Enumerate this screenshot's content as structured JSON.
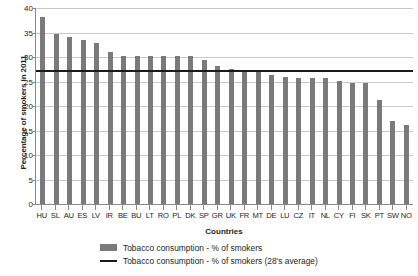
{
  "chart_data": {
    "type": "bar",
    "title": "",
    "xlabel": "Countries",
    "ylabel": "Percentage of smokers in 2011",
    "ylim": [
      0,
      40
    ],
    "ytick_step": 5,
    "yticks": [
      0,
      5,
      10,
      15,
      20,
      25,
      30,
      35,
      40
    ],
    "grid": true,
    "legend_position": "bottom",
    "categories": [
      "HU",
      "SL",
      "AU",
      "ES",
      "LV",
      "IR",
      "BE",
      "BU",
      "LT",
      "RO",
      "PL",
      "DK",
      "SP",
      "GR",
      "UK",
      "FR",
      "MT",
      "DE",
      "LU",
      "CZ",
      "IT",
      "NL",
      "CY",
      "FI",
      "SK",
      "PT",
      "SW",
      "NO"
    ],
    "values": [
      38.2,
      34.7,
      34.1,
      33.5,
      32.8,
      31.1,
      30.2,
      30.2,
      30.2,
      30.2,
      30.2,
      30.2,
      29.3,
      28.1,
      27.5,
      27.3,
      27.0,
      26.3,
      26.0,
      25.7,
      25.7,
      25.7,
      25.2,
      24.7,
      24.7,
      21.3,
      17.0,
      16.2
    ],
    "series": [
      {
        "name": "Tobacco consumption - % of smokers",
        "type": "bar",
        "color": "#7a7a7a",
        "values": [
          38.2,
          34.7,
          34.1,
          33.5,
          32.8,
          31.1,
          30.2,
          30.2,
          30.2,
          30.2,
          30.2,
          30.2,
          29.3,
          28.1,
          27.5,
          27.3,
          27.0,
          26.3,
          26.0,
          25.7,
          25.7,
          25.7,
          25.2,
          24.7,
          24.7,
          21.3,
          17.0,
          16.2
        ]
      },
      {
        "name": "Tobacco consumption - % of smokers (28's average)",
        "type": "line",
        "color": "#1a1a1a",
        "value": 27.3
      }
    ],
    "average_line": 27.3
  },
  "legend": {
    "items": [
      {
        "label": "Tobacco consumption - % of smokers",
        "marker": "bar",
        "color": "#7a7a7a"
      },
      {
        "label": "Tobacco consumption - % of smokers (28's average)",
        "marker": "line",
        "color": "#1a1a1a"
      }
    ]
  }
}
